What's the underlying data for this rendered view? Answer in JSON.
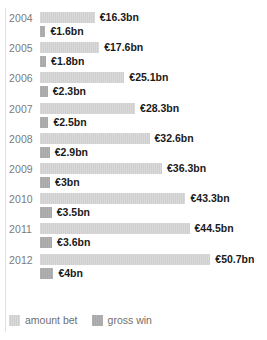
{
  "chart_data": {
    "type": "bar",
    "orientation": "horizontal",
    "title": "",
    "xlabel": "",
    "ylabel": "",
    "categories": [
      "2004",
      "2005",
      "2006",
      "2007",
      "2008",
      "2009",
      "2010",
      "2011",
      "2012"
    ],
    "series": [
      {
        "name": "amount bet",
        "color": "#d5d5d5",
        "unit": "€bn",
        "values": [
          16.3,
          17.6,
          25.1,
          28.3,
          32.6,
          36.3,
          43.3,
          44.5,
          50.7
        ],
        "labels": [
          "€16.3bn",
          "€17.6bn",
          "€25.1bn",
          "€28.3bn",
          "€32.6bn",
          "€36.3bn",
          "€43.3bn",
          "€44.5bn",
          "€50.7bn"
        ]
      },
      {
        "name": "gross win",
        "color": "#adadad",
        "unit": "€bn",
        "values": [
          1.6,
          1.8,
          2.3,
          2.5,
          2.9,
          3.0,
          3.5,
          3.6,
          4.0
        ],
        "labels": [
          "€1.6bn",
          "€1.8bn",
          "€2.3bn",
          "€2.5bn",
          "€2.9bn",
          "€3bn",
          "€3.5bn",
          "€3.6bn",
          "€4bn"
        ]
      }
    ],
    "xlim": [
      0,
      50.7
    ],
    "grid": false,
    "legend_position": "bottom-left"
  },
  "legend": {
    "items": [
      {
        "label": "amount bet",
        "swatch": "amount-bet"
      },
      {
        "label": "gross win",
        "swatch": "gross-win"
      }
    ]
  }
}
